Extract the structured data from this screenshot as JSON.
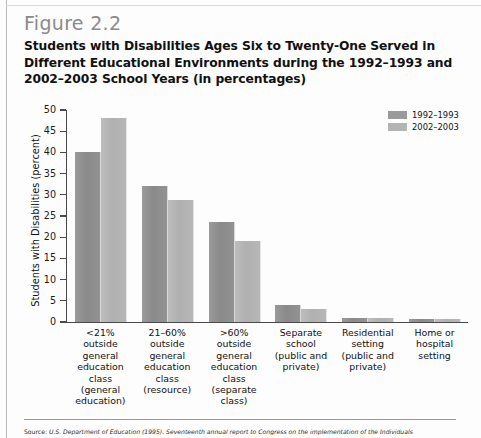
{
  "figure": {
    "number_label": "Figure 2.2",
    "title": "Students with Disabilities Ages Six to Twenty-One Served in Different Educational Environments during the 1992–1993 and 2002–2003 School Years (in percentages)"
  },
  "source": {
    "lead": "Source:",
    "text": " U.S. Department of Education (1995). Seventeenth annual report to Congress on the implementation of the Individuals"
  },
  "legend": {
    "position": "top-right",
    "entries": [
      {
        "label": "1992–1993",
        "color": "#9a9a9a"
      },
      {
        "label": "2002–2003",
        "color": "#b4b4b4"
      }
    ]
  },
  "chart_data": {
    "type": "bar",
    "title": "Students with Disabilities Ages Six to Twenty-One Served in Different Educational Environments during the 1992–1993 and 2002–2003 School Years (in percentages)",
    "xlabel": "",
    "ylabel": "Students with Disabilities (percent)",
    "ylim": [
      0,
      50
    ],
    "yticks": [
      0,
      5,
      10,
      15,
      20,
      25,
      30,
      35,
      40,
      45,
      50
    ],
    "ytick_labels": [
      "0",
      "5",
      "10",
      "15",
      "20",
      "25",
      "30",
      "35",
      "40",
      "45",
      "50"
    ],
    "grid": false,
    "legend_position": "top-right",
    "categories": [
      "<21% outside general education class (general education)",
      "21–60% outside general education class (resource)",
      ">60% outside general education class (separate class)",
      "Separate school (public and private)",
      "Residential setting (public and private)",
      "Home or hospital setting"
    ],
    "category_lines": [
      [
        "<21%",
        "outside",
        "general",
        "education",
        "class",
        "(general",
        "education)"
      ],
      [
        "21–60%",
        "outside",
        "general",
        "education",
        "class",
        "(resource)"
      ],
      [
        ">60%",
        "outside",
        "general",
        "education",
        "class",
        "(separate",
        "class)"
      ],
      [
        "Separate",
        "school",
        "(public and",
        "private)"
      ],
      [
        "Residential",
        "setting",
        "(public and",
        "private)"
      ],
      [
        "Home or",
        "hospital",
        "setting"
      ]
    ],
    "series": [
      {
        "name": "1992–1993",
        "color": "#9a9a9a",
        "values": [
          40,
          32,
          23.5,
          4,
          1,
          0.7
        ]
      },
      {
        "name": "2002–2003",
        "color": "#b4b4b4",
        "values": [
          48,
          28.8,
          19,
          3,
          0.9,
          0.6
        ]
      }
    ]
  }
}
